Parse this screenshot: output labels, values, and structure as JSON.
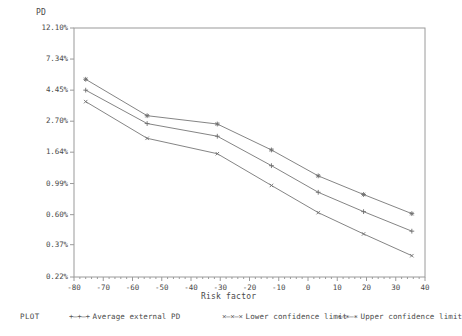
{
  "chart_data": {
    "type": "line",
    "title": "",
    "xlabel": "Risk factor",
    "ylabel": "PD",
    "yscale": "log",
    "grid": false,
    "legend_position": "bottom",
    "legend_title": "PLOT",
    "xlim": [
      -80,
      40
    ],
    "ylim": [
      0.22,
      12.1
    ],
    "xticks": [
      -80,
      -70,
      -60,
      -50,
      -40,
      -30,
      -20,
      -10,
      0,
      10,
      20,
      30,
      40
    ],
    "xtick_labels": [
      "-80",
      "-70",
      "-60",
      "-50",
      "-40",
      "-30",
      "-20",
      "-10",
      "0",
      "10",
      "20",
      "30",
      "40"
    ],
    "yticks": [
      0.22,
      0.37,
      0.6,
      0.99,
      1.64,
      2.7,
      4.45,
      7.34,
      12.1
    ],
    "ytick_labels": [
      "0.22%",
      "0.37%",
      "0.60%",
      "0.99%",
      "1.64%",
      "2.70%",
      "4.45%",
      "7.34%",
      "12.10%"
    ],
    "x": [
      -76,
      -55,
      -31,
      -12.5,
      3.5,
      19,
      35.5
    ],
    "series": [
      {
        "name": "Average external PD",
        "marker": "plus",
        "legend_symbol": "+–+–+",
        "values": [
          4.45,
          2.6,
          2.12,
          1.32,
          0.86,
          0.63,
          0.46
        ]
      },
      {
        "name": "Lower confidence limit",
        "marker": "x",
        "legend_symbol": "×–×–×",
        "values": [
          3.7,
          2.05,
          1.6,
          0.96,
          0.62,
          0.44,
          0.31
        ]
      },
      {
        "name": "Upper confidence limit",
        "marker": "star",
        "legend_symbol": "∗–∗–∗",
        "values": [
          5.3,
          2.95,
          2.58,
          1.7,
          1.12,
          0.83,
          0.61
        ]
      }
    ]
  },
  "axes": {
    "y_label": "PD",
    "x_label": "Risk factor"
  },
  "legend": {
    "title": "PLOT",
    "entries": [
      {
        "symbol": "+–+–+",
        "label": "Average external PD"
      },
      {
        "symbol": "×–×–×",
        "label": "Lower confidence limit"
      },
      {
        "symbol": "∗–∗–∗",
        "label": "Upper confidence limit"
      }
    ]
  },
  "colors": {
    "line": "#6e6e6e",
    "frame": "#9a9a9a",
    "text": "#4a4a4a",
    "background": "#ffffff"
  }
}
